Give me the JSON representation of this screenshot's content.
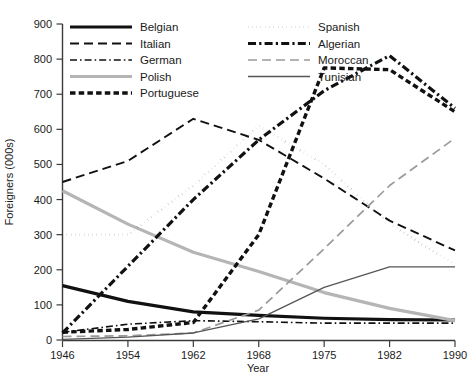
{
  "chart_data": {
    "type": "line",
    "title": "",
    "xlabel": "Year",
    "ylabel": "Foreigners (000s)",
    "x": [
      "1946",
      "1954",
      "1962",
      "1968",
      "1975",
      "1982",
      "1990"
    ],
    "categories": [
      "1946",
      "1954",
      "1962",
      "1968",
      "1975",
      "1982",
      "1990"
    ],
    "xlim": [
      0,
      6
    ],
    "ylim": [
      0,
      900
    ],
    "yticks": [
      0,
      100,
      200,
      300,
      400,
      500,
      600,
      700,
      800,
      900
    ],
    "grid": false,
    "legend_position": "top-left-inside",
    "series": [
      {
        "name": "Belgian",
        "values": [
          155,
          110,
          80,
          70,
          62,
          58,
          57
        ],
        "color": "#111111",
        "style": "solid",
        "width": 3.2
      },
      {
        "name": "Italian",
        "values": [
          450,
          510,
          630,
          570,
          460,
          340,
          255
        ],
        "color": "#111111",
        "style": "dashed",
        "width": 1.9
      },
      {
        "name": "German",
        "values": [
          22,
          45,
          55,
          52,
          48,
          48,
          48
        ],
        "color": "#111111",
        "style": "dashdot",
        "width": 1.6
      },
      {
        "name": "Polish",
        "values": [
          425,
          330,
          250,
          195,
          135,
          90,
          55
        ],
        "color": "#b5b5b5",
        "style": "solid",
        "width": 3.2
      },
      {
        "name": "Portuguese",
        "values": [
          22,
          30,
          50,
          300,
          775,
          770,
          650
        ],
        "color": "#111111",
        "style": "dotted-thick",
        "width": 3.4
      },
      {
        "name": "Spanish",
        "values": [
          300,
          300,
          440,
          610,
          500,
          330,
          215
        ],
        "color": "#111111",
        "style": "dotted",
        "width": 2.6
      },
      {
        "name": "Algerian",
        "values": [
          20,
          210,
          400,
          570,
          710,
          810,
          660
        ],
        "color": "#111111",
        "style": "dashdot-thick",
        "width": 3.2
      },
      {
        "name": "Moroccan",
        "values": [
          10,
          12,
          20,
          85,
          260,
          440,
          575
        ],
        "color": "#9a9a9a",
        "style": "dashed",
        "width": 1.7
      },
      {
        "name": "Tunisian",
        "values": [
          2,
          8,
          20,
          60,
          150,
          208,
          208
        ],
        "color": "#555555",
        "style": "solid",
        "width": 1.3
      }
    ],
    "legend": [
      {
        "label": "Belgian",
        "column": 0,
        "row": 0
      },
      {
        "label": "Italian",
        "column": 0,
        "row": 1
      },
      {
        "label": "German",
        "column": 0,
        "row": 2
      },
      {
        "label": "Polish",
        "column": 0,
        "row": 3
      },
      {
        "label": "Portuguese",
        "column": 0,
        "row": 4
      },
      {
        "label": "Spanish",
        "column": 1,
        "row": 0
      },
      {
        "label": "Algerian",
        "column": 1,
        "row": 1
      },
      {
        "label": "Moroccan",
        "column": 1,
        "row": 2
      },
      {
        "label": "Tunisian",
        "column": 1,
        "row": 3
      }
    ]
  }
}
